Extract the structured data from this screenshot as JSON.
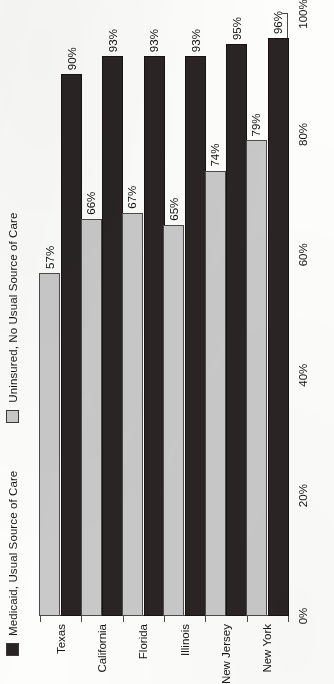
{
  "chart_data": {
    "type": "bar",
    "orientation": "horizontal",
    "title": "",
    "subtitle": "",
    "xlabel": "",
    "ylabel": "",
    "xlim": [
      0,
      100
    ],
    "grid": false,
    "legend_position": "top-left",
    "categories": [
      "Texas",
      "California",
      "Florida",
      "Illinois",
      "New Jersey",
      "New York"
    ],
    "tick_labels": [
      "0%",
      "20%",
      "40%",
      "60%",
      "80%",
      "100%"
    ],
    "tick_values": [
      0,
      20,
      40,
      60,
      80,
      100
    ],
    "series": [
      {
        "name": "Uninsured, No Usual Source of Care",
        "color": "#c9c9c9",
        "values": [
          57,
          66,
          67,
          65,
          74,
          79
        ],
        "value_labels": [
          "57%",
          "66%",
          "67%",
          "65%",
          "74%",
          "79%"
        ]
      },
      {
        "name": "Medicaid, Usual Source of Care",
        "color": "#2a2524",
        "values": [
          90,
          93,
          93,
          93,
          95,
          96
        ],
        "value_labels": [
          "90%",
          "93%",
          "93%",
          "93%",
          "95%",
          "96%"
        ]
      }
    ]
  },
  "legend": {
    "items": [
      {
        "label": "Medicaid, Usual Source of Care",
        "color": "#2a2524"
      },
      {
        "label": "Uninsured, No Usual Source of Care",
        "color": "#c9c9c9"
      }
    ]
  },
  "axis": {
    "value_ticks": [
      "0%",
      "20%",
      "40%",
      "60%",
      "80%",
      "100%"
    ],
    "category_ticks": [
      "Texas",
      "California",
      "Florida",
      "Illinois",
      "New Jersey",
      "New York"
    ]
  },
  "colors": {
    "series_dark": "#2a2524",
    "series_light": "#c9c9c9",
    "axis": "#4a4a4a",
    "text": "#141414",
    "page_background": "#fdfdfc"
  }
}
